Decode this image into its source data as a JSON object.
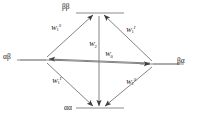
{
  "diagram": {
    "type": "energy-level-diagram",
    "shape": "diamond",
    "stroke_color": "#4d4d4d",
    "text_color": "#1a1a1a",
    "background": "#ffffff",
    "states": [
      {
        "id": "bb",
        "label": "ββ",
        "position": "top"
      },
      {
        "id": "ab",
        "label": "αβ",
        "position": "left"
      },
      {
        "id": "ba",
        "label": "βα",
        "position": "right"
      },
      {
        "id": "aa",
        "label": "αα",
        "position": "bottom"
      }
    ],
    "transitions": [
      {
        "id": "tl",
        "base": "W",
        "sub": "1",
        "sup": "S",
        "from": "ab",
        "to": "bb",
        "edge": "top-left"
      },
      {
        "id": "tr",
        "base": "W",
        "sub": "1",
        "sup": "I",
        "from": "ba",
        "to": "bb",
        "edge": "top-right"
      },
      {
        "id": "bl",
        "base": "W",
        "sub": "1",
        "sup": "I",
        "from": "ab",
        "to": "aa",
        "edge": "bottom-left"
      },
      {
        "id": "br",
        "base": "W",
        "sub": "1",
        "sup": "S",
        "from": "ba",
        "to": "aa",
        "edge": "bottom-right"
      },
      {
        "id": "w2",
        "base": "W",
        "sub": "2",
        "sup": "",
        "from": "bb",
        "to": "aa",
        "edge": "vertical"
      },
      {
        "id": "w0",
        "base": "W",
        "sub": "0",
        "sup": "",
        "from": "ab",
        "to": "ba",
        "edge": "horizontal"
      }
    ]
  }
}
